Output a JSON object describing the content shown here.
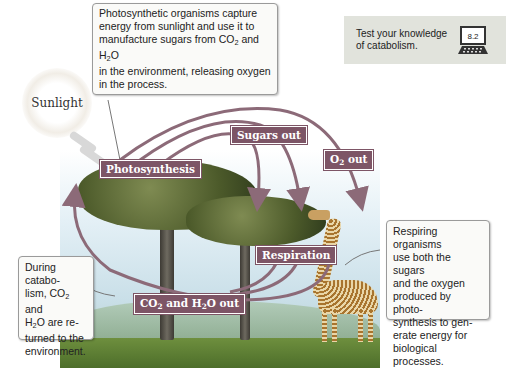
{
  "colors": {
    "label_bg": "#7d5566",
    "arrow": "#8c6a78",
    "test_box_bg": "#e1e3dc",
    "sky": "#e4f0f6",
    "ground": "#5f7f36"
  },
  "test_box": {
    "text": "Test your knowledge of catabolism.",
    "badge": "8.2",
    "icon": "laptop-icon"
  },
  "sun": {
    "label": "Sunlight"
  },
  "callouts": {
    "photosynthesis": {
      "line1": "Photosynthetic organisms capture",
      "line2": "energy from sunlight and use it to",
      "line3_pre": "manufacture sugars from CO",
      "line3_sub1": "2",
      "line3_mid": " and H",
      "line3_sub2": "2",
      "line3_post": "O",
      "line4": "in the environment, releasing oxygen",
      "line5": "in the process."
    },
    "catabolism": {
      "line1": "During catabo-",
      "line2_pre": "lism, CO",
      "line2_sub": "2",
      "line2_post": " and",
      "line3_pre": "H",
      "line3_sub": "2",
      "line3_post": "O are re-",
      "line4": "turned to the",
      "line5": "environment."
    },
    "respiration": {
      "line1": "Respiring organisms",
      "line2": "use both the sugars",
      "line3": "and the oxygen",
      "line4": "produced by photo-",
      "line5": "synthesis to gen-",
      "line6": "erate energy for",
      "line7": "biological processes."
    }
  },
  "labels": {
    "photosynthesis": "Photosynthesis",
    "sugars_out": "Sugars out",
    "o2_out_pre": "O",
    "o2_out_sub": "2",
    "o2_out_post": " out",
    "respiration": "Respiration",
    "co2_pre": "CO",
    "co2_sub": "2",
    "co2_mid": " and H",
    "co2_sub2": "2",
    "co2_post": "O out"
  }
}
